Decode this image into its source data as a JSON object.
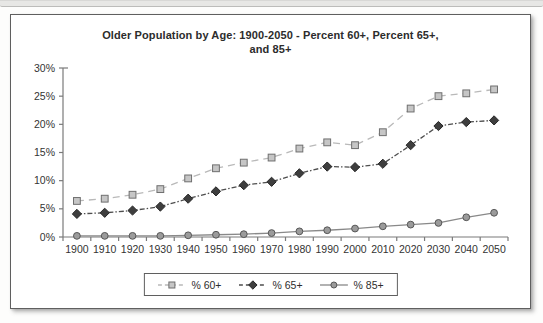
{
  "chart_data": {
    "type": "line",
    "title": "Older Population by Age: 1900-2050 - Percent 60+, Percent 65+, and 85+",
    "title_lines": [
      "Older Population by Age: 1900-2050 - Percent 60+, Percent 65+,",
      "and 85+"
    ],
    "categories": [
      "1900",
      "1910",
      "1920",
      "1930",
      "1940",
      "1950",
      "1960",
      "1970",
      "1980",
      "1990",
      "2000",
      "2010",
      "2020",
      "2030",
      "2040",
      "2050"
    ],
    "series": [
      {
        "name": "% 60+",
        "marker": "square",
        "line_style": "dashed",
        "line_color": "#b9b9b9",
        "marker_fill": "#c6c6c6",
        "marker_stroke": "#6f6f6f",
        "values": [
          6.4,
          6.8,
          7.5,
          8.5,
          10.4,
          12.2,
          13.2,
          14.1,
          15.7,
          16.8,
          16.3,
          18.6,
          22.8,
          25.0,
          25.5,
          26.2
        ]
      },
      {
        "name": "% 65+",
        "marker": "diamond",
        "line_style": "dash-dot",
        "line_color": "#4e4e4e",
        "marker_fill": "#3e3e3e",
        "marker_stroke": "#262626",
        "values": [
          4.1,
          4.3,
          4.7,
          5.4,
          6.8,
          8.1,
          9.2,
          9.8,
          11.3,
          12.5,
          12.4,
          13.0,
          16.3,
          19.7,
          20.4,
          20.7
        ]
      },
      {
        "name": "% 85+",
        "marker": "circle",
        "line_style": "solid",
        "line_color": "#898989",
        "marker_fill": "#9b9b9b",
        "marker_stroke": "#565656",
        "values": [
          0.2,
          0.2,
          0.2,
          0.2,
          0.3,
          0.4,
          0.5,
          0.7,
          1.0,
          1.2,
          1.5,
          1.9,
          2.2,
          2.5,
          3.5,
          4.3
        ]
      }
    ],
    "y_axis": {
      "min": 0,
      "max": 30,
      "step": 5,
      "tick_labels": [
        "0%",
        "5%",
        "10%",
        "15%",
        "20%",
        "25%",
        "30%"
      ],
      "unit": "%"
    },
    "x_axis": {
      "tick_labels": [
        "1900",
        "1910",
        "1920",
        "1930",
        "1940",
        "1950",
        "1960",
        "1970",
        "1980",
        "1990",
        "2000",
        "2010",
        "2020",
        "2030",
        "2040",
        "2050"
      ]
    },
    "legend": {
      "position": "bottom",
      "entries": [
        "% 60+",
        "% 65+",
        "% 85+"
      ]
    },
    "grid": false
  },
  "colors": {
    "panel_border": "#5f5f5f",
    "panel_background": "#ffffff",
    "axis": "#7a7a7a",
    "text": "#333333",
    "page_strip": "#e7e7e5"
  }
}
